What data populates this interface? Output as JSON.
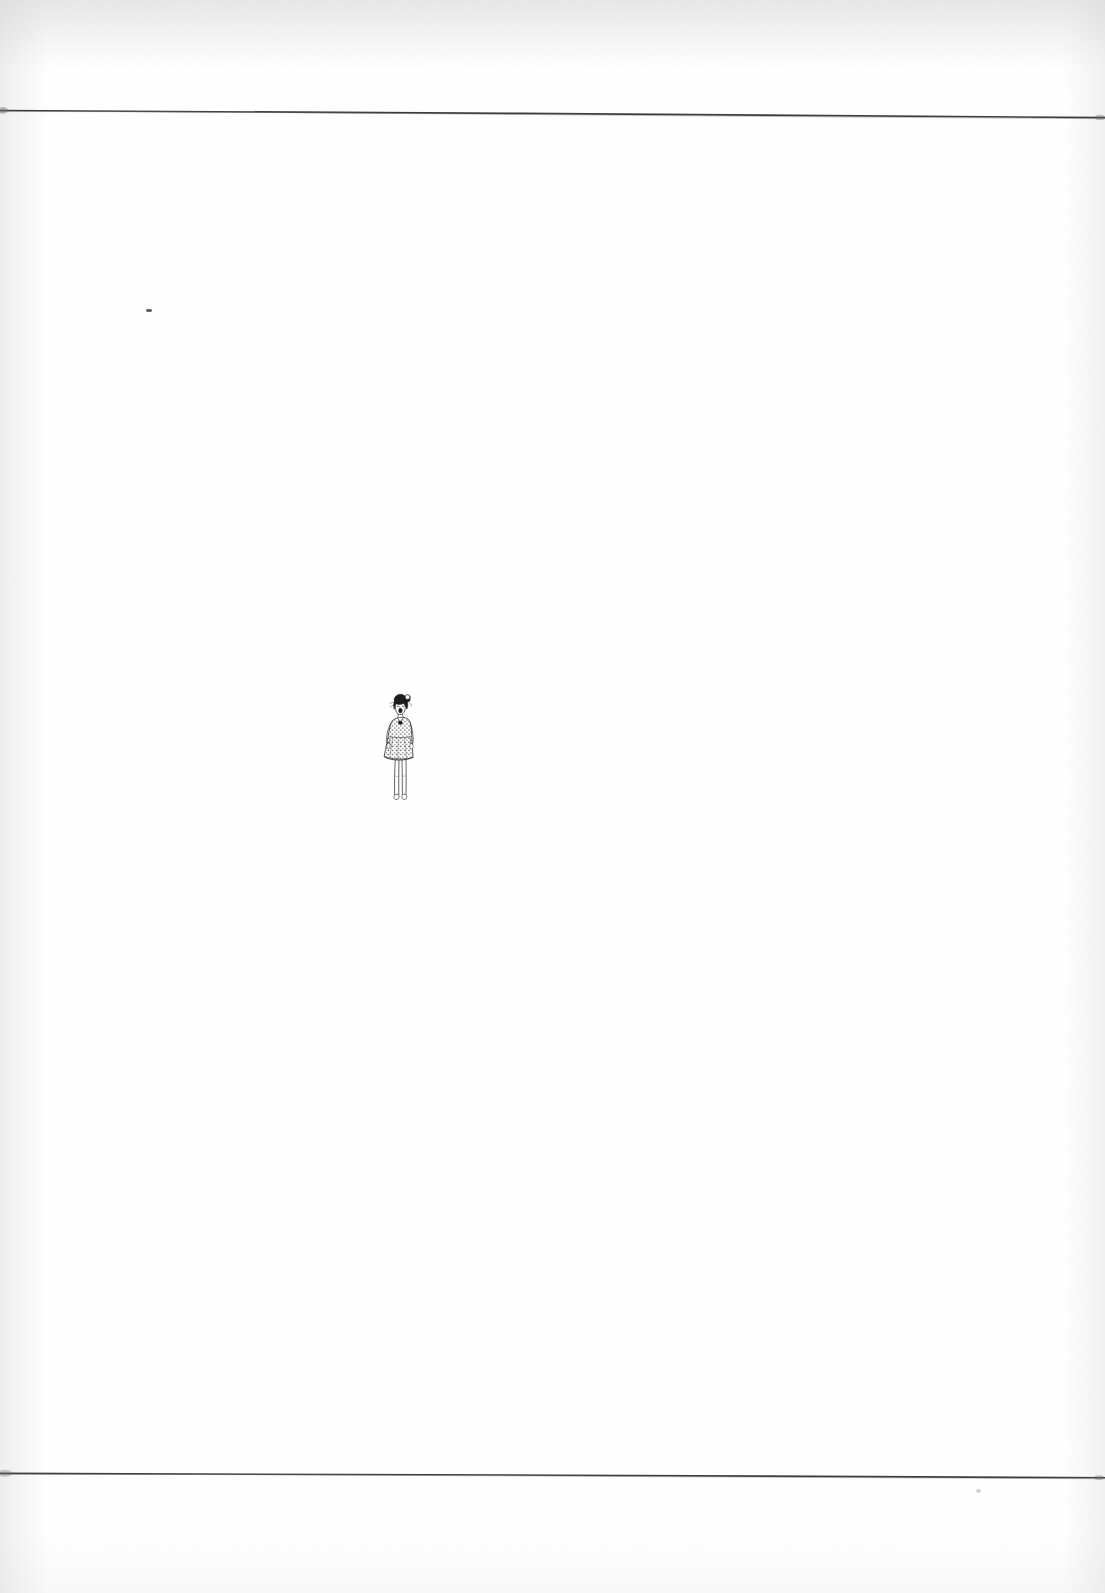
{
  "page": {
    "kind": "scanned-book-page",
    "width": 1105,
    "height": 1593,
    "background_color": "#ffffff",
    "ink_color": "#2b2b2d",
    "caption": "",
    "page_number": ""
  },
  "rules": {
    "top": {
      "name": "top-rule",
      "y_left": 110,
      "y_right": 118,
      "stroke_color": "#3c3c3e",
      "thickness": 1.6
    },
    "bottom": {
      "name": "bottom-rule",
      "y_left": 1473,
      "y_right": 1478,
      "stroke_color": "#3c3c3e",
      "thickness": 1.6
    }
  },
  "illustration": {
    "title": "Standing woman in polka-dot dress",
    "description": "Small pen-and-ink drawing of a woman with short dark hair tied in a topknot, open mouth, wearing a short-sleeved polka-dot dress, arms at her sides, bare legs and feet.",
    "x": 371,
    "y": 692,
    "width": 62,
    "height": 140,
    "ink_color": "#2b2b2d",
    "hair_color": "#1c1c1e",
    "parts": [
      "hair-topknot",
      "face",
      "open-mouth",
      "collar-bow",
      "polka-dot-dress",
      "arms",
      "legs",
      "feet"
    ]
  },
  "marks": [
    {
      "name": "ink-speck-upper-left",
      "x": 146,
      "y": 309,
      "w": 6,
      "h": 3
    },
    {
      "name": "ink-speck-lower-right",
      "x": 976,
      "y": 1489,
      "w": 5,
      "h": 4
    }
  ]
}
